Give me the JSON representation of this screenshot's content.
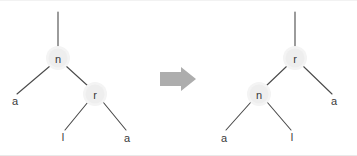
{
  "diagram": {
    "background_color": "#ffffff",
    "line_color": "#4a4a4a",
    "node_halo_color": "#eeeeee",
    "label_color": "#3a3a3a",
    "arrow_color": "#adadad",
    "arrow": {
      "name": "transform-arrow",
      "direction": "right",
      "label": ""
    },
    "left_tree": {
      "name": "tree-before",
      "root_stem": {
        "x": 58,
        "y_top": 11,
        "y_bottom": 46
      },
      "nodes": [
        {
          "id": "n-left",
          "label": "n",
          "x": 58,
          "y": 57,
          "r": 11
        },
        {
          "id": "r-left",
          "label": "r",
          "x": 95,
          "y": 93,
          "r": 11
        }
      ],
      "leaves": [
        {
          "id": "a-left-1",
          "label": "a",
          "x": 15,
          "y": 100
        },
        {
          "id": "l-left",
          "label": "l",
          "x": 63,
          "y": 136
        },
        {
          "id": "a-left-2",
          "label": "a",
          "x": 127,
          "y": 137
        }
      ],
      "edges": [
        {
          "from": "n-left",
          "to": "a-left-1"
        },
        {
          "from": "n-left",
          "to": "r-left"
        },
        {
          "from": "r-left",
          "to": "l-left"
        },
        {
          "from": "r-left",
          "to": "a-left-2"
        }
      ]
    },
    "right_tree": {
      "name": "tree-after",
      "root_stem": {
        "x": 295,
        "y_top": 11,
        "y_bottom": 46
      },
      "nodes": [
        {
          "id": "r-right",
          "label": "r",
          "x": 295,
          "y": 57,
          "r": 11
        },
        {
          "id": "n-right",
          "label": "n",
          "x": 259,
          "y": 93,
          "r": 11
        }
      ],
      "leaves": [
        {
          "id": "a-right-1",
          "label": "a",
          "x": 224,
          "y": 137
        },
        {
          "id": "l-right",
          "label": "l",
          "x": 292,
          "y": 136
        },
        {
          "id": "a-right-2",
          "label": "a",
          "x": 334,
          "y": 100
        }
      ],
      "edges": [
        {
          "from": "r-right",
          "to": "n-right"
        },
        {
          "from": "r-right",
          "to": "a-right-2"
        },
        {
          "from": "n-right",
          "to": "a-right-1"
        },
        {
          "from": "n-right",
          "to": "l-right"
        }
      ]
    }
  }
}
